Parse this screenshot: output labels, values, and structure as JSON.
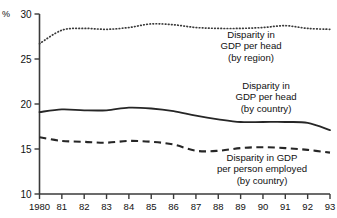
{
  "chart_data": {
    "type": "line",
    "title": "",
    "xlabel": "",
    "ylabel": "%",
    "unit_label": "%",
    "x": [
      1980,
      1981,
      1982,
      1983,
      1984,
      1985,
      1986,
      1987,
      1988,
      1989,
      1990,
      1991,
      1992,
      1993
    ],
    "xtick_labels": [
      "1980",
      "81",
      "82",
      "83",
      "84",
      "85",
      "86",
      "87",
      "88",
      "89",
      "90",
      "91",
      "92",
      "93"
    ],
    "ytick_labels": [
      "10",
      "15",
      "20",
      "25",
      "30"
    ],
    "ytick_values": [
      10,
      15,
      20,
      25,
      30
    ],
    "ylim": [
      10,
      30
    ],
    "xlim": [
      1980,
      1993
    ],
    "grid": false,
    "legend_position": "inline-annotations",
    "series": [
      {
        "name": "Disparity in GDP per head (by region)",
        "style": "dotted",
        "color": "#3a3a3a",
        "values": [
          26.7,
          28.2,
          28.4,
          28.3,
          28.5,
          28.9,
          28.8,
          28.5,
          28.4,
          28.4,
          28.5,
          28.7,
          28.4,
          28.3
        ]
      },
      {
        "name": "Disparity in GDP per head (by country)",
        "style": "solid",
        "color": "#262626",
        "values": [
          19.1,
          19.4,
          19.3,
          19.3,
          19.6,
          19.5,
          19.2,
          18.7,
          18.3,
          18.0,
          18.0,
          18.0,
          17.9,
          17.1
        ]
      },
      {
        "name": "Disparity in GDP per person employed (by country)",
        "style": "dashed",
        "color": "#262626",
        "values": [
          16.3,
          15.9,
          15.8,
          15.7,
          15.9,
          15.8,
          15.5,
          14.8,
          14.8,
          15.1,
          15.2,
          15.1,
          14.9,
          14.6
        ]
      }
    ],
    "annotations": [
      {
        "id": "region",
        "lines": [
          "Disparity in",
          "GDP per head",
          "(by region)"
        ]
      },
      {
        "id": "country",
        "lines": [
          "Disparity in",
          "GDP per head",
          "(by country)"
        ]
      },
      {
        "id": "employed",
        "lines": [
          "Disparity in GDP",
          "per person employed",
          "(by country)"
        ]
      }
    ]
  }
}
